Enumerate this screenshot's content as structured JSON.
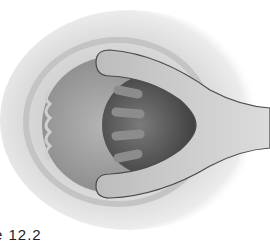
{
  "figure": {
    "caption": "e 12.2",
    "colors": {
      "background": "#ffffff",
      "tissue_outer": "#d8d8d8",
      "tissue_inner": "#a9a9a9",
      "instrument": "#c8c8c8",
      "cavity": "#5a5a5a"
    }
  }
}
